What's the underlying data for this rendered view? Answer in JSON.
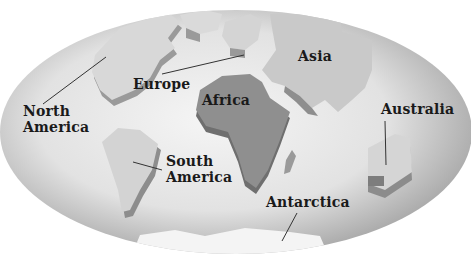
{
  "map": {
    "projection": "oval world map",
    "colors": {
      "ocean_light": "#f2f2f2",
      "ocean_dark": "#a8a8a8",
      "land_light": "#d6d6d6",
      "africa": "#8f8f8f",
      "land_side": "#9a9a9a",
      "text": "#1a1a1a"
    },
    "labels": [
      {
        "id": "north-america",
        "text_line1": "North",
        "text_line2": "America"
      },
      {
        "id": "europe",
        "text": "Europe"
      },
      {
        "id": "asia",
        "text": "Asia"
      },
      {
        "id": "africa",
        "text": "Africa"
      },
      {
        "id": "south-america",
        "text_line1": "South",
        "text_line2": "America"
      },
      {
        "id": "australia",
        "text": "Australia"
      },
      {
        "id": "antarctica",
        "text": "Antarctica"
      }
    ]
  }
}
